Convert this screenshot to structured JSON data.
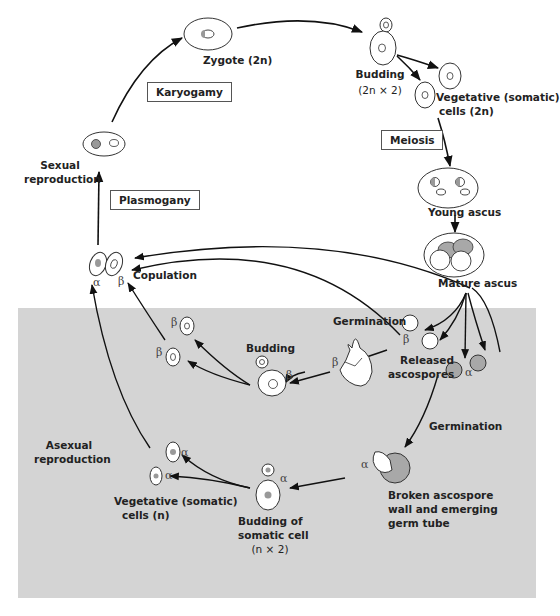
{
  "diagram": {
    "colors": {
      "asexual_panel": "#d4d4d4",
      "spore_shaded": "#a8a8a8",
      "line": "#111111",
      "cell_fill": "#ffffff"
    },
    "process_boxes": {
      "karyogamy": "Karyogamy",
      "plasmogany": "Plasmogany",
      "meiosis": "Meiosis"
    },
    "labels": {
      "zygote": "Zygote (2n)",
      "budding_diploid_1": "Budding",
      "budding_diploid_2": "(2n × 2)",
      "vegetative_diploid_1": "Vegetative (somatic)",
      "vegetative_diploid_2": "cells (2n)",
      "young_ascus": "Young ascus",
      "mature_ascus": "Mature ascus",
      "sexual_reproduction_1": "Sexual",
      "sexual_reproduction_2": "reproduction",
      "copulation": "Copulation",
      "germination_top": "Germination",
      "released_ascospores_1": "Released",
      "released_ascospores_2": "ascospores",
      "budding_haploid": "Budding",
      "germination_bottom": "Germination",
      "broken_ascospore_1": "Broken ascospore",
      "broken_ascospore_2": "wall and emerging",
      "broken_ascospore_3": "germ tube",
      "asexual_reproduction_1": "Asexual",
      "asexual_reproduction_2": "reproduction",
      "vegetative_haploid_1": "Vegetative (somatic)",
      "vegetative_haploid_2": "cells (n)",
      "budding_somatic_1": "Budding of",
      "budding_somatic_2": "somatic cell",
      "budding_somatic_3": "(n × 2)"
    },
    "mating_types": {
      "alpha": "α",
      "beta": "β"
    }
  }
}
